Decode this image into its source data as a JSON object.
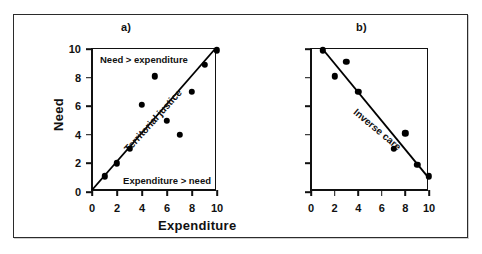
{
  "figure": {
    "panels": [
      {
        "id": "a",
        "label": "a)",
        "axis_x_title": "Expenditure",
        "axis_y_title": "Need",
        "note_upper": "Need  >  expenditure",
        "note_lower": "Expenditure  >  need",
        "trend_label": "Territorial justice"
      },
      {
        "id": "b",
        "label": "b)",
        "trend_label": "Inverse care"
      }
    ],
    "tick_labels_x": [
      "0",
      "2",
      "4",
      "6",
      "8",
      "10"
    ],
    "tick_labels_y": [
      "0",
      "2",
      "4",
      "6",
      "8",
      "10"
    ],
    "colors": {
      "ink": "#111111",
      "frame": "#2b2b2b",
      "background": "#ffffff",
      "marker": "#000000"
    }
  },
  "chart_data": [
    {
      "type": "scatter",
      "title": "a)",
      "xlabel": "Expenditure",
      "ylabel": "Need",
      "xlim": [
        0,
        10
      ],
      "ylim": [
        0,
        10
      ],
      "xticks": [
        0,
        2,
        4,
        6,
        8,
        10
      ],
      "yticks": [
        0,
        2,
        4,
        6,
        8,
        10
      ],
      "grid": false,
      "legend": "none",
      "annotations": [
        "Need  >  expenditure",
        "Expenditure  >  need",
        "Territorial justice"
      ],
      "series": [
        {
          "name": "observations",
          "points": [
            [
              1,
              1.1
            ],
            [
              2,
              2.0
            ],
            [
              3,
              3.0
            ],
            [
              4,
              6.1
            ],
            [
              5,
              8.1
            ],
            [
              6,
              5.0
            ],
            [
              7,
              4.0
            ],
            [
              8,
              7.0
            ],
            [
              9,
              8.9
            ],
            [
              10,
              9.9
            ]
          ]
        },
        {
          "name": "Territorial justice",
          "type": "line",
          "points": [
            [
              0,
              0
            ],
            [
              10,
              10
            ]
          ]
        }
      ]
    },
    {
      "type": "scatter",
      "title": "b)",
      "xlabel": "Expenditure",
      "ylabel": "",
      "xlim": [
        0,
        10
      ],
      "ylim": [
        0,
        10
      ],
      "xticks": [
        0,
        2,
        4,
        6,
        8,
        10
      ],
      "yticks": [
        0,
        2,
        4,
        6,
        8,
        10
      ],
      "grid": false,
      "legend": "none",
      "annotations": [
        "Inverse care"
      ],
      "series": [
        {
          "name": "observations",
          "points": [
            [
              1,
              9.9
            ],
            [
              2,
              8.1
            ],
            [
              3,
              9.1
            ],
            [
              4,
              7.0
            ],
            [
              7,
              3.0
            ],
            [
              8,
              4.1
            ],
            [
              9,
              1.9
            ],
            [
              10,
              1.1
            ]
          ]
        },
        {
          "name": "Inverse care",
          "type": "line",
          "points": [
            [
              1,
              10
            ],
            [
              10,
              1
            ]
          ]
        }
      ]
    }
  ]
}
